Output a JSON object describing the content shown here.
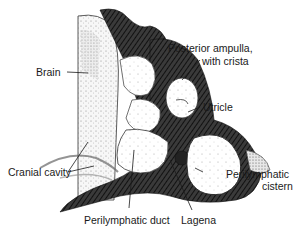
{
  "figure": {
    "type": "anatomical illustration",
    "colors": {
      "ink": "#1a1a1a",
      "dark_tissue": "#2a2a2a",
      "stipple_bg": "#f3f3f3",
      "paper": "#ffffff"
    }
  },
  "labels": {
    "brain": "Brain",
    "posterior_ampulla_line1": "Posterior ampulla,",
    "posterior_ampulla_line2": "with crista",
    "utricle": "Utricle",
    "cranial_cavity": "Cranial cavity",
    "perilymphatic_cistern_line1": "Perilymphatic",
    "perilymphatic_cistern_line2": "cistern",
    "perilymphatic_duct": "Perilymphatic duct",
    "lagena": "Lagena"
  }
}
